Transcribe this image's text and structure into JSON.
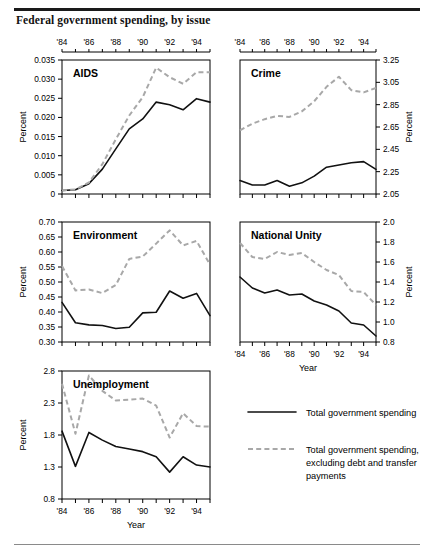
{
  "figure": {
    "title": "Federal government spending, by issue",
    "x_axis_label": "Year",
    "y_axis_label": "Percent",
    "x_tick_labels": [
      "'84",
      "'86",
      "'88",
      "'90",
      "'92",
      "'94"
    ],
    "x_tick_years": [
      1984,
      1986,
      1988,
      1990,
      1992,
      1994
    ]
  },
  "legend": {
    "position": "bottom-right",
    "items": [
      {
        "label": "Total government spending",
        "style": "solid",
        "color": "#111111"
      },
      {
        "label": "Total government spending, excluding debt and transfer payments",
        "style": "dashed",
        "color": "#a8a8a8"
      }
    ]
  },
  "chart_data": [
    {
      "type": "line",
      "title": "AIDS",
      "xlabel": "Year",
      "ylabel": "Percent",
      "x": [
        1984,
        1985,
        1986,
        1987,
        1988,
        1989,
        1990,
        1991,
        1992,
        1993,
        1994,
        1995
      ],
      "xlim": [
        1984,
        1995
      ],
      "ylim": [
        0,
        0.035
      ],
      "yticks": [
        0,
        0.005,
        0.01,
        0.015,
        0.02,
        0.025,
        0.03,
        0.035
      ],
      "ytick_labels": [
        "0",
        "0.005",
        "0.010",
        "0.015",
        "0.020",
        "0.025",
        "0.030",
        "0.035"
      ],
      "y_axis_side": "left",
      "grid": false,
      "series": [
        {
          "name": "Total government spending",
          "style": "solid",
          "values": [
            0.0009,
            0.0011,
            0.0027,
            0.0065,
            0.0118,
            0.017,
            0.0196,
            0.024,
            0.0233,
            0.022,
            0.0249,
            0.024
          ]
        },
        {
          "name": "Total government spending, excluding debt and transfer payments",
          "style": "dashed",
          "values": [
            0.0009,
            0.0012,
            0.003,
            0.0078,
            0.0143,
            0.0205,
            0.0253,
            0.033,
            0.0305,
            0.0288,
            0.0318,
            0.0318
          ]
        }
      ]
    },
    {
      "type": "line",
      "title": "Crime",
      "xlabel": "Year",
      "ylabel": "Percent",
      "x": [
        1984,
        1985,
        1986,
        1987,
        1988,
        1989,
        1990,
        1991,
        1992,
        1993,
        1994,
        1995
      ],
      "xlim": [
        1984,
        1995
      ],
      "ylim": [
        2.05,
        3.25
      ],
      "yticks": [
        2.05,
        2.25,
        2.45,
        2.65,
        2.85,
        3.05,
        3.25
      ],
      "ytick_labels": [
        "2.05",
        "2.25",
        "2.45",
        "2.65",
        "2.85",
        "3.05",
        "3.25"
      ],
      "y_axis_side": "right",
      "grid": false,
      "series": [
        {
          "name": "Total government spending",
          "style": "solid",
          "values": [
            2.17,
            2.13,
            2.13,
            2.17,
            2.12,
            2.15,
            2.21,
            2.29,
            2.31,
            2.33,
            2.34,
            2.27
          ]
        },
        {
          "name": "Total government spending, excluding debt and transfer payments",
          "style": "dashed",
          "values": [
            2.62,
            2.68,
            2.72,
            2.75,
            2.74,
            2.79,
            2.88,
            3.01,
            3.1,
            2.98,
            2.96,
            3.0
          ]
        }
      ]
    },
    {
      "type": "line",
      "title": "Environment",
      "xlabel": "Year",
      "ylabel": "Percent",
      "x": [
        1984,
        1985,
        1986,
        1987,
        1988,
        1989,
        1990,
        1991,
        1992,
        1993,
        1994,
        1995
      ],
      "xlim": [
        1984,
        1995
      ],
      "ylim": [
        0.3,
        0.7
      ],
      "yticks": [
        0.3,
        0.35,
        0.4,
        0.45,
        0.5,
        0.55,
        0.6,
        0.65,
        0.7
      ],
      "ytick_labels": [
        "0.30",
        "0.35",
        "0.40",
        "0.45",
        "0.50",
        "0.55",
        "0.60",
        "0.65",
        "0.70"
      ],
      "y_axis_side": "left",
      "grid": false,
      "series": [
        {
          "name": "Total government spending",
          "style": "solid",
          "values": [
            0.432,
            0.364,
            0.357,
            0.355,
            0.345,
            0.349,
            0.397,
            0.399,
            0.47,
            0.446,
            0.462,
            0.388
          ]
        },
        {
          "name": "Total government spending, excluding debt and transfer payments",
          "style": "dashed",
          "values": [
            0.553,
            0.472,
            0.475,
            0.463,
            0.49,
            0.577,
            0.585,
            0.628,
            0.672,
            0.622,
            0.637,
            0.558
          ]
        }
      ]
    },
    {
      "type": "line",
      "title": "National Unity",
      "xlabel": "Year",
      "ylabel": "Percent",
      "x": [
        1984,
        1985,
        1986,
        1987,
        1988,
        1989,
        1990,
        1991,
        1992,
        1993,
        1994,
        1995
      ],
      "xlim": [
        1984,
        1995
      ],
      "ylim": [
        0.8,
        2.0
      ],
      "yticks": [
        0.8,
        1.0,
        1.2,
        1.4,
        1.6,
        1.8,
        2.0
      ],
      "ytick_labels": [
        "0.8",
        "1.0",
        "1.2",
        "1.4",
        "1.6",
        "1.8",
        "2.0"
      ],
      "y_axis_side": "right",
      "grid": false,
      "series": [
        {
          "name": "Total government spending",
          "style": "solid",
          "values": [
            1.45,
            1.34,
            1.29,
            1.32,
            1.27,
            1.28,
            1.21,
            1.17,
            1.11,
            0.99,
            0.97,
            0.86
          ]
        },
        {
          "name": "Total government spending, excluding debt and transfer payments",
          "style": "dashed",
          "values": [
            1.79,
            1.65,
            1.63,
            1.7,
            1.67,
            1.69,
            1.6,
            1.52,
            1.47,
            1.31,
            1.3,
            1.17
          ]
        }
      ]
    },
    {
      "type": "line",
      "title": "Unemployment",
      "xlabel": "Year",
      "ylabel": "Percent",
      "x": [
        1984,
        1985,
        1986,
        1987,
        1988,
        1989,
        1990,
        1991,
        1992,
        1993,
        1994,
        1995
      ],
      "xlim": [
        1984,
        1995
      ],
      "ylim": [
        0.8,
        2.8
      ],
      "yticks": [
        0.8,
        1.3,
        1.8,
        2.3,
        2.8
      ],
      "ytick_labels": [
        "0.8",
        "1.3",
        "1.8",
        "2.3",
        "2.8"
      ],
      "y_axis_side": "left",
      "grid": false,
      "series": [
        {
          "name": "Total government spending",
          "style": "solid",
          "values": [
            1.86,
            1.31,
            1.84,
            1.72,
            1.62,
            1.58,
            1.54,
            1.46,
            1.22,
            1.46,
            1.33,
            1.3
          ]
        },
        {
          "name": "Total government spending, excluding debt and transfer payments",
          "style": "dashed",
          "values": [
            2.6,
            1.82,
            2.73,
            2.49,
            2.34,
            2.35,
            2.37,
            2.26,
            1.76,
            2.14,
            1.94,
            1.93
          ]
        }
      ]
    }
  ]
}
